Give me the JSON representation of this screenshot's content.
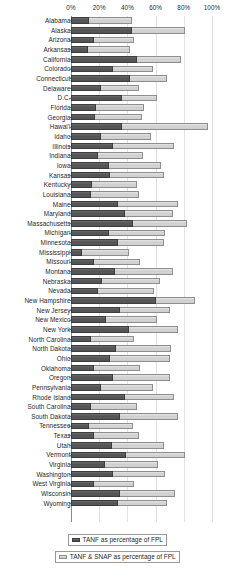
{
  "chart": {
    "type": "bar",
    "orientation": "horizontal",
    "axis_label_suffix": "%"
  },
  "legend": {
    "position": "bottom",
    "items": [
      {
        "label": "TANF as percentage of FPL",
        "swatch": "dark",
        "color": "#555555"
      },
      {
        "label": "TANF & SNAP as percentage of FPL",
        "swatch": "light",
        "color": "#d2d2d2"
      }
    ]
  },
  "chart_data": {
    "type": "bar",
    "title": "",
    "subtitle": "",
    "xlabel": "",
    "ylabel": "",
    "xlim": [
      0,
      100
    ],
    "xticks": [
      0,
      20,
      40,
      60,
      80,
      100
    ],
    "xtick_labels": [
      "0%",
      "20%",
      "40%",
      "60%",
      "80%",
      "100%"
    ],
    "grid": true,
    "legend_position": "bottom",
    "stacked": true,
    "categories": [
      "Alabama",
      "Alaska",
      "Arizona",
      "Arkansas",
      "California",
      "Colorado",
      "Connecticut",
      "Delaware",
      "D.C.",
      "Florida",
      "Georgia",
      "Hawai'i",
      "Idaho",
      "Illinois",
      "Indiana",
      "Iowa",
      "Kansas",
      "Kentucky",
      "Louisiana",
      "Maine",
      "Maryland",
      "Massachusetts",
      "Michigan",
      "Minnesota",
      "Mississippi",
      "Missouri",
      "Montana",
      "Nebraska",
      "Nevada",
      "New Hampshire",
      "New Jersey",
      "New Mexico",
      "New York",
      "North Carolina",
      "North Dakota",
      "Ohio",
      "Oklahoma",
      "Oregon",
      "Pennsylvania",
      "Rhode Island",
      "South Carolina",
      "South Dakota",
      "Tennessee",
      "Texas",
      "Utah",
      "Vermont",
      "Virginia",
      "Washington",
      "West Virginia",
      "Wisconsin",
      "Wyoming"
    ],
    "series": [
      {
        "name": "TANF as percentage of FPL",
        "color": "#555555",
        "values": [
          13,
          43,
          16,
          12,
          47,
          30,
          42,
          21,
          36,
          18,
          17,
          36,
          21,
          30,
          19,
          27,
          28,
          15,
          14,
          33,
          38,
          44,
          27,
          33,
          8,
          16,
          31,
          22,
          19,
          60,
          35,
          25,
          41,
          14,
          32,
          28,
          16,
          30,
          21,
          38,
          14,
          35,
          13,
          16,
          29,
          39,
          24,
          30,
          16,
          35,
          33
        ]
      },
      {
        "name": "TANF & SNAP as percentage of FPL",
        "color": "#d2d2d2",
        "values": [
          43,
          81,
          45,
          42,
          78,
          58,
          68,
          48,
          61,
          52,
          50,
          97,
          57,
          73,
          51,
          64,
          66,
          47,
          48,
          76,
          72,
          82,
          67,
          66,
          41,
          49,
          72,
          63,
          59,
          88,
          70,
          61,
          76,
          45,
          71,
          70,
          49,
          70,
          58,
          73,
          47,
          76,
          44,
          48,
          66,
          81,
          62,
          67,
          45,
          74,
          68
        ]
      }
    ]
  }
}
